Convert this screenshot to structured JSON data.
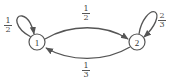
{
  "diagram": {
    "type": "markov-chain-state-diagram",
    "colors": {
      "stroke": "#555555",
      "text": "#444444",
      "background": "#ffffff"
    },
    "states": [
      {
        "id": "1",
        "label": "1"
      },
      {
        "id": "2",
        "label": "2"
      }
    ],
    "transitions": [
      {
        "from": "1",
        "to": "1",
        "label": {
          "num": "1",
          "den": "2"
        }
      },
      {
        "from": "1",
        "to": "2",
        "label": {
          "num": "1",
          "den": "2"
        }
      },
      {
        "from": "2",
        "to": "2",
        "label": {
          "num": "2",
          "den": "3"
        }
      },
      {
        "from": "2",
        "to": "1",
        "label": {
          "num": "1",
          "den": "3"
        }
      }
    ]
  }
}
